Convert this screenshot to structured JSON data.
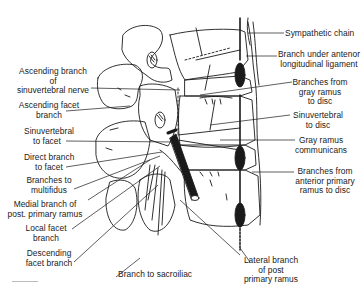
{
  "figure": {
    "labels_left": [
      {
        "id": "ascending-branch-sinuvertebral",
        "lines": [
          "Ascending branch",
          "of",
          "sinuvertebral nerve"
        ]
      },
      {
        "id": "ascending-facet-branch",
        "lines": [
          "Ascending facet",
          "branch"
        ]
      },
      {
        "id": "sinuvertebral-to-facet",
        "lines": [
          "Sinuvertebral",
          "to facet"
        ]
      },
      {
        "id": "direct-branch-to-facet",
        "lines": [
          "Direct branch",
          "to facet"
        ]
      },
      {
        "id": "branches-to-multifidus",
        "lines": [
          "Branches to",
          "multifidus"
        ]
      },
      {
        "id": "medial-branch-post-primary-ramus",
        "lines": [
          "Medial branch of",
          "post. primary ramus"
        ]
      },
      {
        "id": "local-facet-branch",
        "lines": [
          "Local facet",
          "branch"
        ]
      },
      {
        "id": "descending-facet-branch",
        "lines": [
          "Descending",
          "facet branch"
        ]
      }
    ],
    "labels_bottom": [
      {
        "id": "branch-to-sacroiliac",
        "lines": [
          "Branch to sacroiliac"
        ]
      },
      {
        "id": "lateral-branch-post-primary-ramus",
        "lines": [
          "Lateral branch",
          "of post",
          "primary ramus"
        ]
      }
    ],
    "labels_right": [
      {
        "id": "sympathetic-chain",
        "lines": [
          "Sympathetic chain"
        ]
      },
      {
        "id": "branch-under-anterior-longitudinal-ligament",
        "lines": [
          "Branch under antenor",
          "longitudinal ligament"
        ]
      },
      {
        "id": "branches-gray-ramus-to-disc",
        "lines": [
          "Branches from",
          "gray ramus",
          "to disc"
        ]
      },
      {
        "id": "sinuvertebral-to-disc",
        "lines": [
          "Sinuvertebral",
          "to disc"
        ]
      },
      {
        "id": "gray-ramus-communicans",
        "lines": [
          "Gray ramus",
          "communicans"
        ]
      },
      {
        "id": "branches-anterior-primary-ramus-to-disc",
        "lines": [
          "Branches from",
          "anterior primary",
          "ramus to disc"
        ]
      }
    ]
  }
}
